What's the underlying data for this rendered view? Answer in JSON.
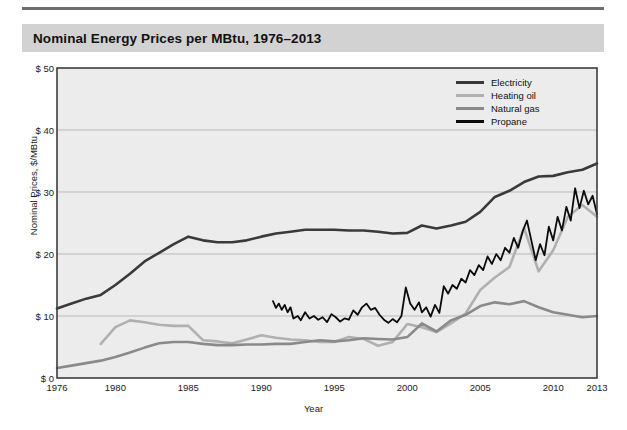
{
  "figure": {
    "title": "Nominal Energy Prices per MBtu, 1976–2013",
    "title_band_color": "#d2d2d2",
    "rule_color": "#6e6e6e",
    "plot_bg_color": "#ececec",
    "grid_color": "#b9b9b9",
    "axis_color": "#3d3d3d"
  },
  "chart_data": {
    "type": "line",
    "title": "Nominal Energy Prices per MBtu, 1976–2013",
    "xlabel": "Year",
    "ylabel": "Nominal Prices, $/MBtu",
    "xlim": [
      1976,
      2013
    ],
    "ylim": [
      0,
      50
    ],
    "grid": true,
    "legend_position": "top-right",
    "ytick_labels": [
      "$ 0",
      "$ 10",
      "$ 20",
      "$ 30",
      "$ 40",
      "$ 50"
    ],
    "ytick_values": [
      0,
      10,
      20,
      30,
      40,
      50
    ],
    "xtick_labels": [
      "1976",
      "1980",
      "1985",
      "1990",
      "1995",
      "2000",
      "2005",
      "2010",
      "2013"
    ],
    "xtick_values": [
      1976,
      1980,
      1985,
      1990,
      1995,
      2000,
      2005,
      2010,
      2013
    ],
    "series": [
      {
        "name": "Electricity",
        "color": "#3a3a3a",
        "width": 2.6,
        "x": [
          1976,
          1977,
          1978,
          1979,
          1980,
          1981,
          1982,
          1983,
          1984,
          1985,
          1986,
          1987,
          1988,
          1989,
          1990,
          1991,
          1992,
          1993,
          1994,
          1995,
          1996,
          1997,
          1998,
          1999,
          2000,
          2001,
          2002,
          2003,
          2004,
          2005,
          2006,
          2007,
          2008,
          2009,
          2010,
          2011,
          2012,
          2013
        ],
        "values": [
          11.2,
          12.0,
          12.8,
          13.4,
          15.0,
          16.8,
          18.8,
          20.2,
          21.6,
          22.8,
          22.2,
          21.9,
          21.9,
          22.2,
          22.8,
          23.3,
          23.6,
          23.9,
          23.9,
          23.9,
          23.8,
          23.8,
          23.6,
          23.3,
          23.4,
          24.6,
          24.1,
          24.6,
          25.2,
          26.8,
          29.2,
          30.2,
          31.6,
          32.5,
          32.6,
          33.2,
          33.6,
          34.6
        ]
      },
      {
        "name": "Heating oil",
        "color": "#b0b0b0",
        "width": 2.6,
        "x": [
          1979,
          1980,
          1981,
          1982,
          1983,
          1984,
          1985,
          1986,
          1987,
          1988,
          1989,
          1990,
          1991,
          1992,
          1993,
          1994,
          1995,
          1996,
          1997,
          1998,
          1999,
          2000,
          2001,
          2002,
          2003,
          2004,
          2005,
          2006,
          2007,
          2008,
          2009,
          2010,
          2011,
          2012,
          2013
        ],
        "values": [
          5.5,
          8.2,
          9.3,
          9.0,
          8.6,
          8.4,
          8.4,
          6.1,
          5.9,
          5.6,
          6.2,
          6.9,
          6.5,
          6.2,
          6.1,
          5.8,
          5.8,
          6.6,
          6.3,
          5.2,
          5.8,
          8.7,
          8.2,
          7.4,
          8.8,
          10.4,
          14.2,
          16.2,
          17.9,
          24.2,
          17.2,
          20.6,
          26.0,
          27.9,
          26.0
        ]
      },
      {
        "name": "Natural gas",
        "color": "#8a8a8a",
        "width": 2.6,
        "x": [
          1976,
          1977,
          1978,
          1979,
          1980,
          1981,
          1982,
          1983,
          1984,
          1985,
          1986,
          1987,
          1988,
          1989,
          1990,
          1991,
          1992,
          1993,
          1994,
          1995,
          1996,
          1997,
          1998,
          1999,
          2000,
          2001,
          2002,
          2003,
          2004,
          2005,
          2006,
          2007,
          2008,
          2009,
          2010,
          2011,
          2012,
          2013
        ],
        "values": [
          1.6,
          2.0,
          2.4,
          2.8,
          3.4,
          4.1,
          4.9,
          5.6,
          5.8,
          5.8,
          5.5,
          5.3,
          5.3,
          5.4,
          5.4,
          5.5,
          5.5,
          5.8,
          6.1,
          5.9,
          6.1,
          6.4,
          6.3,
          6.2,
          6.6,
          8.8,
          7.5,
          9.3,
          10.2,
          11.6,
          12.2,
          11.9,
          12.4,
          11.4,
          10.6,
          10.2,
          9.8,
          10.0
        ]
      },
      {
        "name": "Propane",
        "color": "#0b0b0b",
        "width": 1.8,
        "x": [
          1990.8,
          1991.0,
          1991.2,
          1991.4,
          1991.6,
          1991.8,
          1992.0,
          1992.2,
          1992.5,
          1992.7,
          1993.0,
          1993.3,
          1993.6,
          1993.9,
          1994.2,
          1994.5,
          1994.8,
          1995.1,
          1995.4,
          1995.7,
          1996.0,
          1996.3,
          1996.6,
          1996.9,
          1997.2,
          1997.5,
          1997.8,
          1998.1,
          1998.4,
          1998.7,
          1999.0,
          1999.3,
          1999.6,
          1999.9,
          2000.2,
          2000.5,
          2000.8,
          2001.0,
          2001.3,
          2001.6,
          2001.9,
          2002.2,
          2002.5,
          2002.8,
          2003.1,
          2003.4,
          2003.7,
          2004.0,
          2004.3,
          2004.6,
          2004.9,
          2005.2,
          2005.5,
          2005.8,
          2006.1,
          2006.4,
          2006.7,
          2007.0,
          2007.3,
          2007.6,
          2007.9,
          2008.2,
          2008.5,
          2008.8,
          2009.1,
          2009.4,
          2009.7,
          2010.0,
          2010.3,
          2010.6,
          2010.9,
          2011.2,
          2011.5,
          2011.8,
          2012.1,
          2012.4,
          2012.7,
          2013.0
        ],
        "values": [
          12.4,
          11.3,
          12.0,
          11.0,
          11.8,
          10.6,
          11.4,
          9.6,
          10.0,
          9.3,
          10.6,
          9.6,
          10.0,
          9.4,
          9.8,
          9.0,
          10.3,
          9.8,
          9.1,
          9.6,
          9.4,
          10.9,
          10.2,
          11.4,
          12.0,
          11.0,
          11.3,
          10.2,
          9.4,
          8.9,
          9.5,
          9.0,
          10.0,
          14.6,
          12.0,
          11.0,
          12.2,
          10.6,
          11.4,
          9.9,
          11.8,
          10.5,
          14.8,
          13.6,
          15.0,
          14.4,
          16.0,
          15.4,
          17.4,
          16.6,
          18.2,
          17.4,
          19.6,
          18.4,
          20.0,
          19.0,
          21.0,
          20.2,
          22.6,
          21.0,
          23.6,
          25.4,
          22.2,
          19.0,
          21.6,
          19.8,
          24.4,
          22.2,
          26.0,
          23.8,
          27.6,
          25.4,
          30.6,
          27.4,
          30.2,
          28.0,
          29.4,
          26.4
        ]
      }
    ]
  },
  "legend": {
    "entries": [
      {
        "label": "Electricity",
        "color": "#3a3a3a"
      },
      {
        "label": "Heating oil",
        "color": "#b0b0b0"
      },
      {
        "label": "Natural gas",
        "color": "#8a8a8a"
      },
      {
        "label": "Propane",
        "color": "#0b0b0b"
      }
    ]
  }
}
